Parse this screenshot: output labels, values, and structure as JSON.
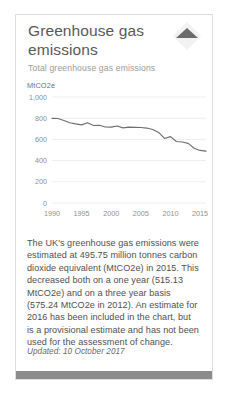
{
  "card": {
    "title": "Greenhouse gas emissions",
    "subtitle": "Total greenhouse gas emissions",
    "toggle_icon": "triangle-up-icon",
    "body_text": "The UK's greenhouse gas emissions were estimated at 495.75 million tonnes carbon dioxide equivalent (MtCO2e) in 2015. This decreased both on a one year (515.13 MtCO2e) and on a three year basis (575.24 MtCO2e in 2012). An estimate for 2016 has been included in the chart, but is a provisional estimate and has not been used for the assessment of change.",
    "updated": "Updated: 10 October 2017",
    "accent_color": "#8c8c8c",
    "line_color": "#6e6e6e",
    "border_color": "#dddddd"
  },
  "chart_data": {
    "type": "line",
    "title": "",
    "unit_label": "MtCO2e",
    "xlabel": "",
    "ylabel": "MtCO2e",
    "xlim": [
      1990,
      2016
    ],
    "ylim": [
      0,
      1000
    ],
    "grid": "horizontal",
    "legend": "none",
    "ytick_labels": [
      "0",
      "200",
      "400",
      "600",
      "800",
      "1,000"
    ],
    "yticks": [
      0,
      200,
      400,
      600,
      800,
      1000
    ],
    "xtick_labels": [
      "1990",
      "1995",
      "2000",
      "2005",
      "2010",
      "2015"
    ],
    "xticks": [
      1990,
      1995,
      2000,
      2005,
      2010,
      2015
    ],
    "x": [
      1990,
      1991,
      1992,
      1993,
      1994,
      1995,
      1996,
      1997,
      1998,
      1999,
      2000,
      2001,
      2002,
      2003,
      2004,
      2005,
      2006,
      2007,
      2008,
      2009,
      2010,
      2011,
      2012,
      2013,
      2014,
      2015,
      2016
    ],
    "values": [
      799,
      797,
      779,
      757,
      746,
      737,
      757,
      731,
      733,
      717,
      716,
      727,
      709,
      716,
      714,
      712,
      707,
      693,
      666,
      609,
      626,
      580,
      575,
      563,
      517,
      496,
      489
    ],
    "series": [
      {
        "name": "Total greenhouse gas emissions",
        "values": [
          799,
          797,
          779,
          757,
          746,
          737,
          757,
          731,
          733,
          717,
          716,
          727,
          709,
          716,
          714,
          712,
          707,
          693,
          666,
          609,
          626,
          580,
          575,
          563,
          517,
          496,
          489
        ]
      }
    ],
    "annotations": {
      "2015_value": 495.75,
      "2014_value": 515.13,
      "2012_value": 575.24
    }
  }
}
